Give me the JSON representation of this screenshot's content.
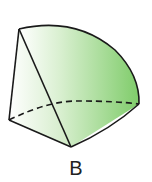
{
  "figure": {
    "label": "B",
    "colors": {
      "fill_light": "#f3faf0",
      "fill_dark": "#7fcc6a",
      "stroke": "#1a1a1a"
    }
  }
}
